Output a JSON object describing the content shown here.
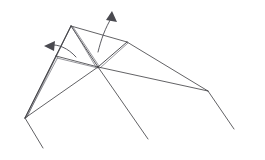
{
  "figure": {
    "type": "line-drawing",
    "background_color": "#ffffff",
    "line_color": "#3a3a3e",
    "line_color_light": "#6b6b72",
    "arrow_color": "#4a4a50",
    "canvas": {
      "width": 265,
      "height": 160
    }
  },
  "vertices": {
    "top_apex": {
      "name": "top-apex",
      "x": 71,
      "y": 26
    },
    "second_peak": {
      "name": "second-peak",
      "x": 127,
      "y": 42
    },
    "center_hub": {
      "name": "center-hub",
      "x": 98,
      "y": 67
    },
    "left_mid": {
      "name": "left-mid-vertex",
      "x": 56,
      "y": 56
    },
    "left_point": {
      "name": "left-sharp-point",
      "x": 25,
      "y": 118
    },
    "right_knee": {
      "name": "right-knee-vertex",
      "x": 208,
      "y": 91
    },
    "right_leg_end": {
      "name": "right-leg-end",
      "x": 234,
      "y": 129
    },
    "left_leg_end": {
      "name": "left-leg-end",
      "x": 43,
      "y": 148
    },
    "center_leg_end": {
      "name": "center-leg-end",
      "x": 148,
      "y": 139
    }
  },
  "strokes": [
    {
      "name": "edge-apex-to-left-point-outer",
      "d": "M 71 26 L 25 118",
      "width": 0.9,
      "shade": "dark"
    },
    {
      "name": "edge-apex-to-left-point-inner",
      "d": "M 71 26 L 27 117",
      "width": 0.7,
      "shade": "light"
    },
    {
      "name": "edge-apex-to-center-a",
      "d": "M 71 26 L 98 67",
      "width": 0.9,
      "shade": "dark"
    },
    {
      "name": "edge-apex-to-center-b",
      "d": "M 72 27 L 96 67",
      "width": 0.7,
      "shade": "light"
    },
    {
      "name": "edge-apex-to-center-c",
      "d": "M 73 27 L 99 66",
      "width": 0.7,
      "shade": "light"
    },
    {
      "name": "edge-apex-to-second-peak",
      "d": "M 71 26 L 127 42",
      "width": 0.8,
      "shade": "dark"
    },
    {
      "name": "edge-apex-to-left-mid",
      "d": "M 71 26 L 56 56",
      "width": 0.8,
      "shade": "dark"
    },
    {
      "name": "edge-left-mid-to-center",
      "d": "M 56 56 L 98 67",
      "width": 0.8,
      "shade": "dark"
    },
    {
      "name": "edge-left-mid-to-center-2",
      "d": "M 57 58 L 98 68",
      "width": 0.7,
      "shade": "light"
    },
    {
      "name": "edge-left-mid-to-left-point",
      "d": "M 56 56 L 25 118",
      "width": 0.8,
      "shade": "dark"
    },
    {
      "name": "edge-left-mid-to-left-point-2",
      "d": "M 58 57 L 26 118",
      "width": 0.7,
      "shade": "light"
    },
    {
      "name": "edge-left-point-to-center",
      "d": "M 25 118 L 98 67",
      "width": 0.8,
      "shade": "dark"
    },
    {
      "name": "edge-second-peak-to-center",
      "d": "M 127 42 L 98 67",
      "width": 0.9,
      "shade": "dark"
    },
    {
      "name": "edge-second-peak-to-center-2",
      "d": "M 128 43 L 100 68",
      "width": 0.7,
      "shade": "light"
    },
    {
      "name": "edge-second-peak-to-right-knee",
      "d": "M 127 42 L 208 91",
      "width": 0.8,
      "shade": "dark"
    },
    {
      "name": "edge-center-to-right-knee",
      "d": "M 98 67 L 208 91",
      "width": 0.8,
      "shade": "dark"
    },
    {
      "name": "edge-right-knee-to-right-leg-end",
      "d": "M 208 91 L 234 129",
      "width": 0.8,
      "shade": "dark"
    },
    {
      "name": "edge-left-point-to-left-leg-end",
      "d": "M 25 118 L 43 148",
      "width": 0.8,
      "shade": "dark"
    },
    {
      "name": "edge-center-to-center-leg-end",
      "d": "M 98 67 L 148 139",
      "width": 0.8,
      "shade": "dark"
    }
  ],
  "arrows": [
    {
      "name": "fold-arrow-up-right",
      "label": "upward fold motion arrow",
      "path": "M 98 52 C 101 40 105 28 112 17",
      "head_points": "112,11 117,22 106,20",
      "head_rotation": -32,
      "width": 0.9
    },
    {
      "name": "fold-arrow-left",
      "label": "leftward fold motion arrow",
      "path": "M 76 57 C 68 48 58 44 50 45",
      "head_points": "44,46 55,41 54,51",
      "head_rotation": 0,
      "width": 0.9
    }
  ]
}
